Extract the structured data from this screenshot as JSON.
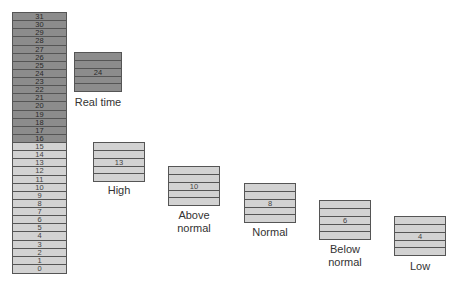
{
  "colors": {
    "realtime_range": "#8c8c8c",
    "dynamic_range": "#d2d2d2",
    "border": "#555555",
    "text": "#333333"
  },
  "priority_column": {
    "levels": [
      "31",
      "30",
      "29",
      "28",
      "27",
      "26",
      "25",
      "24",
      "23",
      "22",
      "21",
      "20",
      "19",
      "18",
      "17",
      "16",
      "15",
      "14",
      "13",
      "12",
      "11",
      "10",
      "9",
      "8",
      "7",
      "6",
      "5",
      "4",
      "3",
      "2",
      "1",
      "0"
    ],
    "realtime_range": [
      16,
      31
    ],
    "dynamic_range": [
      0,
      15
    ]
  },
  "classes": [
    {
      "name": "Real time",
      "label_line1": "Real time",
      "label_line2": "",
      "base_priority": "24",
      "range": "realtime"
    },
    {
      "name": "High",
      "label_line1": "High",
      "label_line2": "",
      "base_priority": "13",
      "range": "dynamic"
    },
    {
      "name": "Above normal",
      "label_line1": "Above",
      "label_line2": "normal",
      "base_priority": "10",
      "range": "dynamic"
    },
    {
      "name": "Normal",
      "label_line1": "Normal",
      "label_line2": "",
      "base_priority": "8",
      "range": "dynamic"
    },
    {
      "name": "Below normal",
      "label_line1": "Below",
      "label_line2": "normal",
      "base_priority": "6",
      "range": "dynamic"
    },
    {
      "name": "Low",
      "label_line1": "Low",
      "label_line2": "",
      "base_priority": "4",
      "range": "dynamic"
    }
  ]
}
